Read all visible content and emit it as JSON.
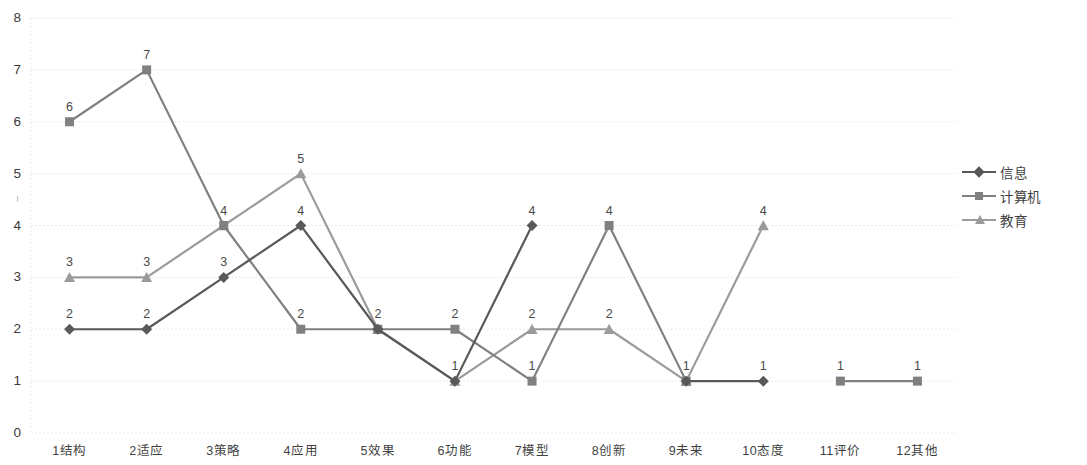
{
  "chart_data": {
    "type": "line",
    "title": "",
    "xlabel": "",
    "ylabel": "",
    "ylim": [
      0,
      8
    ],
    "y_ticks": [
      0,
      1,
      2,
      3,
      4,
      5,
      6,
      7,
      8
    ],
    "grid": true,
    "legend_position": "right",
    "categories": [
      "1结构",
      "2适应",
      "3策略",
      "4应用",
      "5效果",
      "6功能",
      "7模型",
      "8创新",
      "9未来",
      "10态度",
      "11评价",
      "12其他"
    ],
    "series": [
      {
        "name": "信息",
        "marker": "diamond",
        "color": "#595959",
        "values": [
          2,
          2,
          3,
          4,
          2,
          1,
          4,
          null,
          1,
          1,
          null,
          null
        ],
        "labels": [
          "2",
          "2",
          "3",
          "4",
          null,
          null,
          "4",
          null,
          null,
          "1",
          null,
          null
        ]
      },
      {
        "name": "计算机",
        "marker": "square",
        "color": "#808080",
        "values": [
          6,
          7,
          4,
          2,
          2,
          2,
          1,
          4,
          1,
          null,
          1,
          1
        ],
        "labels": [
          "6",
          "7",
          null,
          "2",
          "2",
          "2",
          "1",
          "4",
          null,
          null,
          "1",
          "1"
        ]
      },
      {
        "name": "教育",
        "marker": "triangle",
        "color": "#9b9b9b",
        "values": [
          3,
          3,
          4,
          5,
          2,
          1,
          2,
          2,
          1,
          4,
          null,
          null
        ],
        "labels": [
          "3",
          "3",
          "4",
          "5",
          null,
          "1",
          "2",
          "2",
          "1",
          "4",
          null,
          null
        ]
      }
    ]
  },
  "axis": {
    "y_title_glyph": "ı"
  },
  "colors": {
    "grid": "#eaeaea",
    "axis_text": "#3f3f3f",
    "background": "#ffffff"
  }
}
